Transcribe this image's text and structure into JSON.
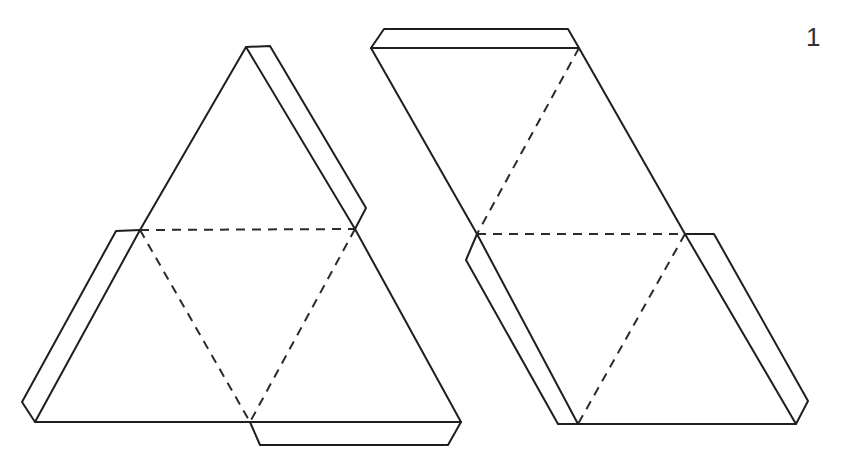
{
  "figure": {
    "label": "1",
    "colors": {
      "line": "#1e1e1e",
      "background": "#ffffff"
    }
  },
  "nets": [
    {
      "name": "triangular-net",
      "faces": 4,
      "tabs": 3,
      "outline": [
        [
          35,
          422
        ],
        [
          140,
          230
        ],
        [
          246,
          47
        ],
        [
          355,
          229
        ],
        [
          461,
          422
        ]
      ],
      "fold_lines": [
        [
          [
            140,
            230
          ],
          [
            355,
            229
          ]
        ],
        [
          [
            140,
            230
          ],
          [
            250,
            422
          ]
        ],
        [
          [
            355,
            229
          ],
          [
            250,
            422
          ]
        ]
      ],
      "tabs_points": [
        [
          [
            246,
            47
          ],
          [
            270,
            46
          ],
          [
            366,
            208
          ],
          [
            355,
            229
          ]
        ],
        [
          [
            140,
            230
          ],
          [
            116,
            231
          ],
          [
            22,
            402
          ],
          [
            35,
            422
          ]
        ],
        [
          [
            250,
            422
          ],
          [
            260,
            445
          ],
          [
            448,
            445
          ],
          [
            461,
            422
          ]
        ]
      ]
    },
    {
      "name": "parallelogram-net",
      "faces": 4,
      "tabs": 3,
      "outline": [
        [
          371,
          48
        ],
        [
          579,
          48
        ],
        [
          685,
          234
        ],
        [
          796,
          424
        ],
        [
          578,
          424
        ],
        [
          477,
          234
        ]
      ],
      "fold_lines": [
        [
          [
            579,
            48
          ],
          [
            477,
            234
          ]
        ],
        [
          [
            477,
            234
          ],
          [
            685,
            234
          ]
        ],
        [
          [
            685,
            234
          ],
          [
            578,
            424
          ]
        ]
      ],
      "tabs_points": [
        [
          [
            371,
            48
          ],
          [
            384,
            29
          ],
          [
            568,
            29
          ],
          [
            579,
            48
          ]
        ],
        [
          [
            477,
            234
          ],
          [
            466,
            260
          ],
          [
            558,
            424
          ],
          [
            578,
            424
          ]
        ],
        [
          [
            685,
            234
          ],
          [
            714,
            234
          ],
          [
            808,
            401
          ],
          [
            796,
            424
          ]
        ]
      ]
    }
  ]
}
